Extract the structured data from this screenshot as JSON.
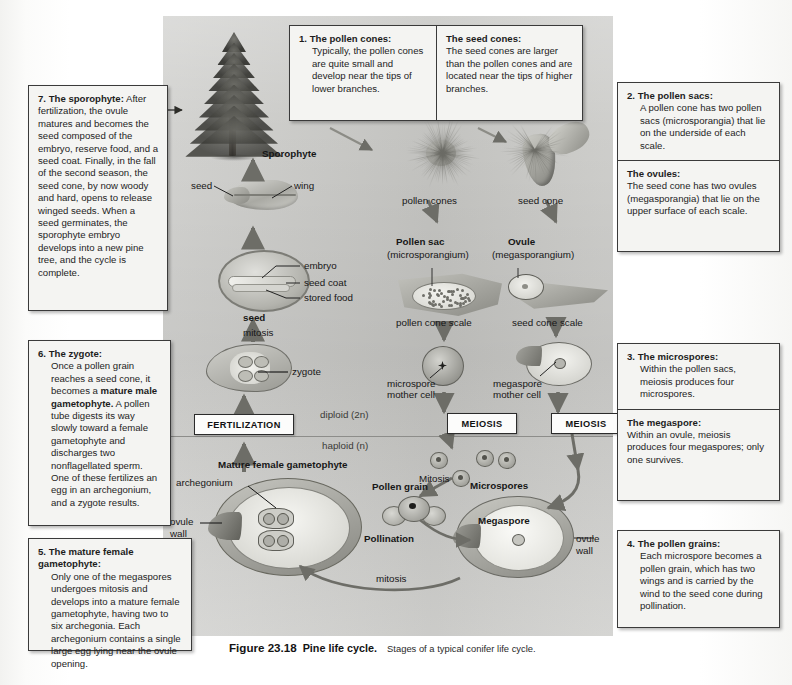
{
  "figure": {
    "number": "Figure 23.18",
    "title": "Pine life cycle.",
    "subtitle": "Stages of a typical conifer life cycle."
  },
  "colors": {
    "panel_gray": "#c9c9c6",
    "box_fill": "#f4f4f2",
    "box_border": "#3a3a3a",
    "page": "#ffffff",
    "text": "#1a1a1a"
  },
  "callouts": {
    "box1_left": {
      "num": "1.",
      "heading": "The pollen cones:",
      "body": "Typically, the pollen cones are quite small and develop near the tips of lower branches."
    },
    "box1_right": {
      "heading": "The seed cones:",
      "body": "The seed cones are larger than the pollen cones and are located near the tips of higher branches."
    },
    "box2_top": {
      "num": "2.",
      "heading": "The pollen sacs:",
      "body": "A pollen cone has two pollen sacs (microsporangia) that lie on the underside of each scale."
    },
    "box2_bottom": {
      "heading": "The ovules:",
      "body": "The seed cone has two ovules (megasporangia) that lie on the upper surface of each scale."
    },
    "box3_top": {
      "num": "3.",
      "heading": "The microspores:",
      "body": "Within the pollen sacs, meiosis produces four microspores."
    },
    "box3_bottom": {
      "heading": "The megaspore:",
      "body": "Within an ovule, meiosis produces four megaspores; only one survives."
    },
    "box4": {
      "num": "4.",
      "heading": "The pollen grains:",
      "body": "Each microspore becomes a pollen grain, which has two wings and is carried by the wind to the seed cone during pollination."
    },
    "box5": {
      "num": "5.",
      "heading": "The mature female gametophyte:",
      "body": "Only one of the megaspores undergoes mitosis and develops into a mature female gametophyte, having two to six archegonia. Each archegonium contains a single large egg lying near the ovule opening."
    },
    "box6": {
      "num": "6.",
      "heading": "The zygote:",
      "body_pre": "Once a pollen grain reaches a seed cone, it becomes a ",
      "body_bold": "mature male gametophyte.",
      "body_post": " A pollen tube digests its way slowly toward a female gametophyte and discharges two nonflagellated sperm. One of these fertilizes an egg in an archegonium, and a zygote results."
    },
    "box7": {
      "num": "7.",
      "heading": "The sporophyte:",
      "body": " After fertilization, the ovule matures and becomes the seed composed of the embryo, reserve food, and a seed coat. Finally, in the fall of the second season, the seed cone, by now woody and hard, opens to release winged seeds. When a seed germinates, the sporophyte embryo develops into a new pine tree, and the cycle is complete."
    }
  },
  "diagram_labels": {
    "sporophyte": "Sporophyte",
    "seed_wing_left": "seed",
    "seed_wing_right": "wing",
    "embryo": "embryo",
    "seed_coat": "seed coat",
    "stored_food": "stored food",
    "seed": "seed",
    "mitosis_seed": "mitosis",
    "zygote": "zygote",
    "fertilization": "FERTILIZATION",
    "diploid": "diploid (2n)",
    "haploid": "haploid (n)",
    "pollen_cones": "pollen cones",
    "seed_cone": "seed cone",
    "pollen_sac": "Pollen sac",
    "pollen_sac_sub": "(microsporangium)",
    "ovule": "Ovule",
    "ovule_sub": "(megasporangium)",
    "pollen_cone_scale": "pollen cone scale",
    "seed_cone_scale": "seed cone scale",
    "microspore_mother_cell_1": "microspore",
    "microspore_mother_cell_2": "mother cell",
    "megaspore_mother_cell_1": "megaspore",
    "megaspore_mother_cell_2": "mother cell",
    "meiosis_left": "MEIOSIS",
    "meiosis_right": "MEIOSIS",
    "microspores": "Microspores",
    "mitosis_upper": "Mitosis",
    "pollen_grain": "Pollen grain",
    "pollination": "Pollination",
    "megaspore": "Megaspore",
    "ovule_wall_right_1": "ovule",
    "ovule_wall_right_2": "wall",
    "mitosis_lower": "mitosis",
    "mature_female_gametophyte": "Mature female gametophyte",
    "archegonium": "archegonium",
    "ovule_wall_left_1": "ovule",
    "ovule_wall_left_2": "wall"
  }
}
